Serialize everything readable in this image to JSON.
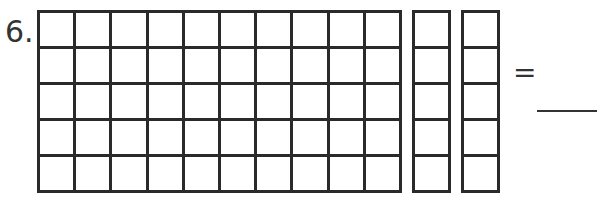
{
  "problem": {
    "number": "6.",
    "main_grid": {
      "rows": 5,
      "cols": 10,
      "label": "hundred-block partial (50 units)"
    },
    "strips": [
      {
        "rows": 5,
        "cols": 1,
        "label": "ten-strip (5)"
      },
      {
        "rows": 5,
        "cols": 1,
        "label": "ten-strip (5)"
      }
    ],
    "equals": "=",
    "answer_blank": ""
  }
}
